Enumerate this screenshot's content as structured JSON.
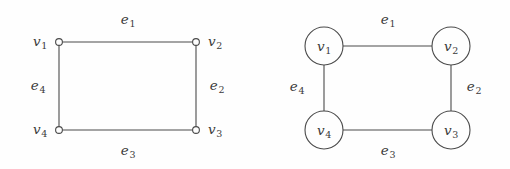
{
  "figure": {
    "background_color": "#fefefe",
    "line_color": "#4a4a4a",
    "text_color": "#3b3b3b"
  },
  "diagrams": [
    {
      "id": "left-graph",
      "style": "open-dot-vertices-labels-outside",
      "vertices": [
        {
          "id": "v1",
          "label": "v",
          "sub": "1",
          "x": 59,
          "y": 42,
          "label_x": 40,
          "label_y": 42
        },
        {
          "id": "v2",
          "label": "v",
          "sub": "2",
          "x": 196,
          "y": 42,
          "label_x": 215,
          "label_y": 42
        },
        {
          "id": "v3",
          "label": "v",
          "sub": "3",
          "x": 196,
          "y": 130,
          "label_x": 215,
          "label_y": 130
        },
        {
          "id": "v4",
          "label": "v",
          "sub": "4",
          "x": 59,
          "y": 130,
          "label_x": 40,
          "label_y": 130
        }
      ],
      "edges": [
        {
          "id": "e1",
          "label": "e",
          "sub": "1",
          "from": "v1",
          "to": "v2",
          "label_x": 128,
          "label_y": 20
        },
        {
          "id": "e2",
          "label": "e",
          "sub": "2",
          "from": "v2",
          "to": "v3",
          "label_x": 217,
          "label_y": 86
        },
        {
          "id": "e3",
          "label": "e",
          "sub": "3",
          "from": "v3",
          "to": "v4",
          "label_x": 128,
          "label_y": 151
        },
        {
          "id": "e4",
          "label": "e",
          "sub": "4",
          "from": "v4",
          "to": "v1",
          "label_x": 38,
          "label_y": 86
        }
      ]
    },
    {
      "id": "right-graph",
      "style": "circled-vertices-labels-inside",
      "vertex_radius": 19,
      "vertices": [
        {
          "id": "v1",
          "label": "v",
          "sub": "1",
          "x": 69,
          "y": 46
        },
        {
          "id": "v2",
          "label": "v",
          "sub": "2",
          "x": 196,
          "y": 46
        },
        {
          "id": "v3",
          "label": "v",
          "sub": "3",
          "x": 196,
          "y": 130
        },
        {
          "id": "v4",
          "label": "v",
          "sub": "4",
          "x": 69,
          "y": 130
        }
      ],
      "edges": [
        {
          "id": "e1",
          "label": "e",
          "sub": "1",
          "from": "v1",
          "to": "v2",
          "label_x": 133,
          "label_y": 20
        },
        {
          "id": "e2",
          "label": "e",
          "sub": "2",
          "from": "v2",
          "to": "v3",
          "label_x": 219,
          "label_y": 87
        },
        {
          "id": "e3",
          "label": "e",
          "sub": "3",
          "from": "v3",
          "to": "v4",
          "label_x": 133,
          "label_y": 151
        },
        {
          "id": "e4",
          "label": "e",
          "sub": "4",
          "from": "v4",
          "to": "v1",
          "label_x": 42,
          "label_y": 87
        }
      ]
    }
  ]
}
